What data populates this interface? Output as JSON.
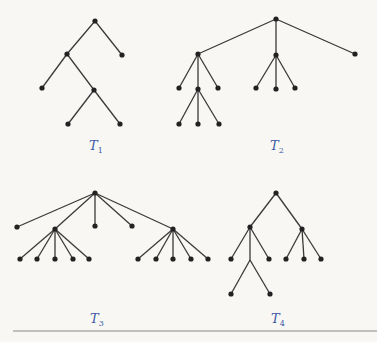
{
  "figure": {
    "trees": [
      {
        "id": "T1",
        "label": "T",
        "subscript": "1",
        "nodes": [
          {
            "id": "r",
            "x": 95,
            "y": 21
          },
          {
            "id": "a",
            "x": 67,
            "y": 54
          },
          {
            "id": "b",
            "x": 122,
            "y": 55
          },
          {
            "id": "c",
            "x": 42,
            "y": 88
          },
          {
            "id": "d",
            "x": 94,
            "y": 90
          },
          {
            "id": "e",
            "x": 68,
            "y": 124
          },
          {
            "id": "f",
            "x": 120,
            "y": 124
          }
        ],
        "edges": [
          [
            "r",
            "a"
          ],
          [
            "r",
            "b"
          ],
          [
            "a",
            "c"
          ],
          [
            "a",
            "d"
          ],
          [
            "d",
            "e"
          ],
          [
            "d",
            "f"
          ]
        ]
      },
      {
        "id": "T2",
        "label": "T",
        "subscript": "2",
        "nodes": [
          {
            "id": "r",
            "x": 276,
            "y": 19
          },
          {
            "id": "a",
            "x": 198,
            "y": 54
          },
          {
            "id": "b",
            "x": 276,
            "y": 55
          },
          {
            "id": "c",
            "x": 355,
            "y": 54
          },
          {
            "id": "a1",
            "x": 179,
            "y": 88
          },
          {
            "id": "a2",
            "x": 198,
            "y": 89
          },
          {
            "id": "a3",
            "x": 218,
            "y": 88
          },
          {
            "id": "a21",
            "x": 179,
            "y": 124
          },
          {
            "id": "a22",
            "x": 198,
            "y": 124
          },
          {
            "id": "a23",
            "x": 219,
            "y": 124
          },
          {
            "id": "b1",
            "x": 256,
            "y": 88
          },
          {
            "id": "b2",
            "x": 276,
            "y": 89
          },
          {
            "id": "b3",
            "x": 295,
            "y": 88
          }
        ],
        "edges": [
          [
            "r",
            "a"
          ],
          [
            "r",
            "b"
          ],
          [
            "r",
            "c"
          ],
          [
            "a",
            "a1"
          ],
          [
            "a",
            "a2"
          ],
          [
            "a",
            "a3"
          ],
          [
            "a2",
            "a21"
          ],
          [
            "a2",
            "a22"
          ],
          [
            "a2",
            "a23"
          ],
          [
            "b",
            "b1"
          ],
          [
            "b",
            "b2"
          ],
          [
            "b",
            "b3"
          ]
        ]
      },
      {
        "id": "T3",
        "label": "T",
        "subscript": "3",
        "nodes": [
          {
            "id": "r",
            "x": 95,
            "y": 193
          },
          {
            "id": "c1",
            "x": 17,
            "y": 227
          },
          {
            "id": "c2",
            "x": 55,
            "y": 229
          },
          {
            "id": "c3",
            "x": 95,
            "y": 226
          },
          {
            "id": "c4",
            "x": 132,
            "y": 226
          },
          {
            "id": "c5",
            "x": 173,
            "y": 229
          },
          {
            "id": "l1",
            "x": 20,
            "y": 259
          },
          {
            "id": "l2",
            "x": 37,
            "y": 259
          },
          {
            "id": "l3",
            "x": 55,
            "y": 259
          },
          {
            "id": "l4",
            "x": 73,
            "y": 259
          },
          {
            "id": "l5",
            "x": 89,
            "y": 259
          },
          {
            "id": "m1",
            "x": 138,
            "y": 259
          },
          {
            "id": "m2",
            "x": 156,
            "y": 259
          },
          {
            "id": "m3",
            "x": 173,
            "y": 259
          },
          {
            "id": "m4",
            "x": 191,
            "y": 259
          },
          {
            "id": "m5",
            "x": 208,
            "y": 259
          }
        ],
        "edges": [
          [
            "r",
            "c1"
          ],
          [
            "r",
            "c2"
          ],
          [
            "r",
            "c3"
          ],
          [
            "r",
            "c4"
          ],
          [
            "r",
            "c5"
          ],
          [
            "c2",
            "l1"
          ],
          [
            "c2",
            "l2"
          ],
          [
            "c2",
            "l3"
          ],
          [
            "c2",
            "l4"
          ],
          [
            "c2",
            "l5"
          ],
          [
            "c5",
            "m1"
          ],
          [
            "c5",
            "m2"
          ],
          [
            "c5",
            "m3"
          ],
          [
            "c5",
            "m4"
          ],
          [
            "c5",
            "m5"
          ]
        ]
      },
      {
        "id": "T4",
        "label": "T",
        "subscript": "4",
        "nodes": [
          {
            "id": "r",
            "x": 276,
            "y": 193
          },
          {
            "id": "a",
            "x": 250,
            "y": 227
          },
          {
            "id": "b",
            "x": 302,
            "y": 229
          },
          {
            "id": "a1",
            "x": 231,
            "y": 259
          },
          {
            "id": "a2",
            "x": 250,
            "y": 260,
            "hidden": true
          },
          {
            "id": "a3",
            "x": 269,
            "y": 259
          },
          {
            "id": "a21",
            "x": 231,
            "y": 294
          },
          {
            "id": "a22",
            "x": 270,
            "y": 294
          },
          {
            "id": "b1",
            "x": 286,
            "y": 259
          },
          {
            "id": "b2",
            "x": 304,
            "y": 259
          },
          {
            "id": "b3",
            "x": 321,
            "y": 259
          }
        ],
        "edges": [
          [
            "r",
            "a"
          ],
          [
            "r",
            "b"
          ],
          [
            "a",
            "a1"
          ],
          [
            "a",
            "a2"
          ],
          [
            "a",
            "a3"
          ],
          [
            "a2",
            "a21"
          ],
          [
            "a2",
            "a22"
          ],
          [
            "b",
            "b1"
          ],
          [
            "b",
            "b2"
          ],
          [
            "b",
            "b3"
          ]
        ]
      }
    ],
    "labels": [
      {
        "tree": "T1",
        "x": 94,
        "y": 150
      },
      {
        "tree": "T2",
        "x": 275,
        "y": 150
      },
      {
        "tree": "T3",
        "x": 95,
        "y": 323
      },
      {
        "tree": "T4",
        "x": 276,
        "y": 323
      }
    ]
  }
}
